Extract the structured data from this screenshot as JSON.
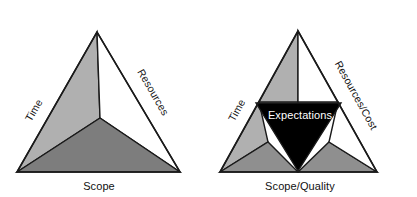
{
  "figure": {
    "type": "diagram",
    "subtype": "project-management-triangle-pair",
    "background_color": "#ffffff"
  },
  "palette": {
    "light_grey": "#b0b0b0",
    "mid_grey": "#8f8f8f",
    "dark_grey": "#7d7d7d",
    "white": "#ffffff",
    "black": "#000000",
    "outline": "#1a1a1a",
    "text_dark": "#111111",
    "text_light": "#ffffff"
  },
  "diagrams": [
    {
      "id": "classic-triple-constraint",
      "name": "Triple Constraint Triangle",
      "geometry": {
        "apex": [
          97,
          32
        ],
        "bottom_left": [
          17,
          172
        ],
        "bottom_right": [
          180,
          172
        ],
        "center": [
          100,
          118
        ]
      },
      "sectors": [
        {
          "name": "time-sector",
          "fill": "#b0b0b0",
          "points": "17,172 97,32 100,118"
        },
        {
          "name": "resources-sector",
          "fill": "#ffffff",
          "points": "97,32 180,172 100,118"
        },
        {
          "name": "scope-sector",
          "fill": "#7d7d7d",
          "points": "17,172 100,118 180,172"
        }
      ],
      "labels": {
        "left_edge": "Time",
        "right_edge": "Resources",
        "base": "Scope"
      }
    },
    {
      "id": "expectations-triangle",
      "name": "Expectations Triangle",
      "geometry": {
        "apex": [
          298,
          31
        ],
        "bottom_left": [
          220,
          172
        ],
        "bottom_right": [
          377,
          172
        ],
        "mid_left": [
          259,
          102
        ],
        "mid_right": [
          338,
          102
        ],
        "mid_bottom": [
          298,
          172
        ],
        "center": [
          298,
          118
        ]
      },
      "sectors": [
        {
          "name": "time-upper-sector",
          "fill": "#b0b0b0",
          "points": "298,31 259,102 298,102"
        },
        {
          "name": "resources-upper-sector",
          "fill": "#ffffff",
          "points": "298,31 298,102 338,102"
        },
        {
          "name": "time-lower-sector",
          "fill": "#b0b0b0",
          "points": "220,172 259,102 268,142"
        },
        {
          "name": "scope-left-sector",
          "fill": "#8f8f8f",
          "points": "220,172 268,142 298,172"
        },
        {
          "name": "scope-right-sector",
          "fill": "#8f8f8f",
          "points": "298,172 329,142 377,172"
        },
        {
          "name": "resources-lower-sector",
          "fill": "#ffffff",
          "points": "338,102 377,172 329,142"
        }
      ],
      "expectations_triangle": {
        "name": "expectations-core",
        "fill": "#000000",
        "points": "256,103 341,103 298,171",
        "label": "Expectations"
      },
      "labels": {
        "left_edge": "Time",
        "right_edge": "Resources/Cost",
        "base": "Scope/Quality"
      }
    }
  ]
}
